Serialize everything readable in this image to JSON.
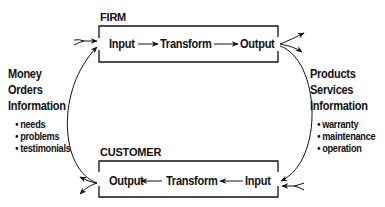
{
  "firm": {
    "title": "FIRM",
    "nodes": [
      "Input",
      "Transform",
      "Output"
    ]
  },
  "customer": {
    "title": "CUSTOMER",
    "nodes": [
      "Output",
      "Transform",
      "Input"
    ]
  },
  "left_flow": {
    "lines": [
      "Money",
      "Orders",
      "Information"
    ],
    "bullets": [
      "needs",
      "problems",
      "testimonials"
    ]
  },
  "right_flow": {
    "lines": [
      "Products",
      "Services",
      "Information"
    ],
    "bullets": [
      "warranty",
      "maintenance",
      "operation"
    ]
  },
  "colors": {
    "ink": "#111111",
    "background": "#ffffff"
  }
}
